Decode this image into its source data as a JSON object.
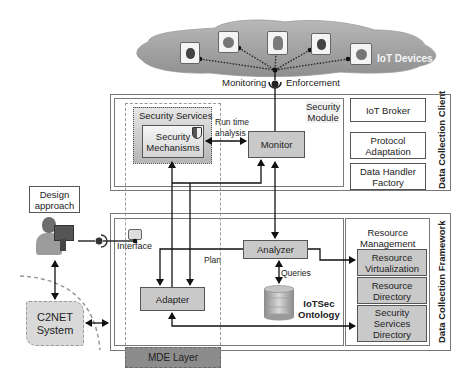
{
  "cloud": {
    "label": "IoT Devices",
    "devices": [
      {
        "icon": "raspberry-pi-icon"
      },
      {
        "icon": "arduino-icon"
      },
      {
        "icon": "pinecone-board-icon"
      },
      {
        "icon": "raspberry-pi-icon"
      },
      {
        "icon": "arduino-icon"
      }
    ]
  },
  "connector": {
    "monitoring": "Monitoring",
    "enforcement": "Enforcement"
  },
  "client": {
    "title": "Data Collection Client",
    "security_module": "Security\nModule",
    "security_services": "Security Services",
    "security_mechanisms": "Security\nMechanisms",
    "runtime_analysis": "Run time\nanalysis",
    "monitor": "Monitor",
    "right_column": [
      "IoT Broker",
      "Protocol\nAdaptation",
      "Data Handler\nFactory"
    ]
  },
  "framework": {
    "title": "Data Collection Framework",
    "interface": "Interface",
    "analyzer": "Analyzer",
    "plan": "Plan",
    "queries": "Queries",
    "adapter": "Adapter",
    "ontology": "IoTSec\nOntology",
    "resource_management": "Resource\nManagement",
    "resources": [
      "Resource\nVirtualization",
      "Resource\nDirectory",
      "Security\nServices\nDirectory"
    ]
  },
  "left": {
    "design_approach": "Design\napproach",
    "c2net": "C2NET\nSystem"
  },
  "mde_layer": "MDE Layer"
}
